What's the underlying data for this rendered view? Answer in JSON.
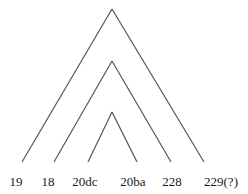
{
  "diagram": {
    "type": "tree",
    "line_color": "#555555",
    "background": "#ffffff",
    "leaves": [
      {
        "label": "19",
        "x": 16
      },
      {
        "label": "18",
        "x": 48
      },
      {
        "label": "20dc",
        "x": 85
      },
      {
        "label": "20ba",
        "x": 133
      },
      {
        "label": "228",
        "x": 172
      },
      {
        "label": "229(?)",
        "x": 221
      }
    ],
    "clades": [
      {
        "name": "outer",
        "apex": [
          112,
          9
        ],
        "left_leaf": "19",
        "right_leaf": "229(?)"
      },
      {
        "name": "middle",
        "apex": [
          112,
          61
        ],
        "left_leaf": "18",
        "right_leaf": "228"
      },
      {
        "name": "inner",
        "apex": [
          112,
          112
        ],
        "left_leaf": "20dc",
        "right_leaf": "20ba"
      }
    ]
  }
}
